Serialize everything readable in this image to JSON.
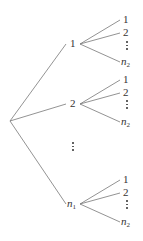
{
  "diagram": {
    "type": "tree",
    "root": {
      "label": ""
    },
    "level1": [
      {
        "label": "1",
        "children": [
          "1",
          "2",
          "⋮",
          "n₂"
        ]
      },
      {
        "label": "2",
        "children": [
          "1",
          "2",
          "⋮",
          "n₂"
        ]
      },
      {
        "label": "⋮",
        "children": []
      },
      {
        "label": "n₁",
        "children": [
          "1",
          "2",
          "⋮",
          "n₂"
        ]
      }
    ],
    "labels": {
      "n": "n",
      "sub1": "1",
      "sub2": "2",
      "one": "1",
      "two": "2"
    },
    "line_color": "#666666"
  }
}
